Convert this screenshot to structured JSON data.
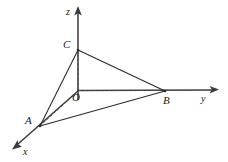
{
  "figure": {
    "kind": "3d-coordinate-tetrahedron",
    "background_color": "#ffffff",
    "line_color": "#2b2b2b",
    "axis_color": "#3a3a3a",
    "dashed_color": "#4a4a4a",
    "label_color": "#202020"
  },
  "axes": [
    {
      "id": "z",
      "label": "z",
      "from": {
        "x": 78,
        "y": 100
      },
      "to": {
        "x": 78,
        "y": 10
      },
      "arrow": true,
      "label_pos": {
        "x": 66,
        "y": 7
      }
    },
    {
      "id": "y",
      "label": "y",
      "from": {
        "x": 78,
        "y": 91
      },
      "to": {
        "x": 216,
        "y": 90
      },
      "arrow": true,
      "label_pos": {
        "x": 201,
        "y": 94
      }
    },
    {
      "id": "x",
      "label": "x",
      "from": {
        "x": 78,
        "y": 91
      },
      "to": {
        "x": 15,
        "y": 147
      },
      "arrow": true,
      "label_pos": {
        "x": 23,
        "y": 147
      }
    }
  ],
  "points": [
    {
      "id": "O",
      "label": "O",
      "x": 78,
      "y": 91,
      "label_pos": {
        "x": 72,
        "y": 92
      },
      "on_axis": "origin"
    },
    {
      "id": "C",
      "label": "C",
      "x": 78,
      "y": 50,
      "label_pos": {
        "x": 63,
        "y": 39
      },
      "on_axis": "z"
    },
    {
      "id": "B",
      "label": "B",
      "x": 165,
      "y": 91,
      "label_pos": {
        "x": 163,
        "y": 95
      },
      "on_axis": "y"
    },
    {
      "id": "A",
      "label": "A",
      "x": 40,
      "y": 126,
      "label_pos": {
        "x": 25,
        "y": 115
      },
      "on_axis": "x"
    }
  ],
  "edges_solid": [
    {
      "id": "AC",
      "from": "A",
      "to": "C"
    },
    {
      "id": "CB",
      "from": "C",
      "to": "B"
    },
    {
      "id": "AB",
      "from": "A",
      "to": "B"
    }
  ],
  "edges_dashed": [
    {
      "id": "OC",
      "from": "O",
      "to": "C"
    },
    {
      "id": "OB",
      "from": "O",
      "to": "B"
    },
    {
      "id": "OA",
      "from": "O",
      "to": "A"
    }
  ]
}
